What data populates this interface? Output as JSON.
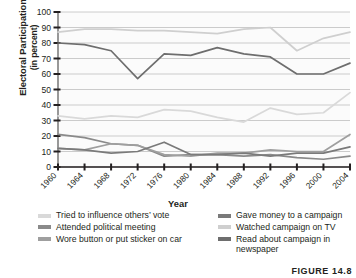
{
  "figure": {
    "caption": "FIGURE 14.8"
  },
  "axes": {
    "y_title_main": "Electoral Participation",
    "y_title_sub": "(in percent)",
    "x_title": "Year"
  },
  "legend": {
    "left_column": [
      {
        "label": "Tried to influence others’ vote",
        "color": "#d9d9d9"
      },
      {
        "label": "Attended political meeting",
        "color": "#8a8a8a"
      },
      {
        "label": "Wore button or put sticker on car",
        "color": "#9f9f9f"
      }
    ],
    "right_column": [
      {
        "label": "Gave money to a campaign",
        "color": "#7a7a7a"
      },
      {
        "label": "Watched campaign on TV",
        "color": "#cfcfcf"
      },
      {
        "label": "Read about campaign in newspaper",
        "color": "#6e6e6e"
      }
    ]
  },
  "chart_data": {
    "type": "line",
    "title": "",
    "xlabel": "Year",
    "ylabel": "Electoral Participation (in percent)",
    "ylim": [
      0,
      100
    ],
    "ytick_step": 10,
    "yticks": [
      0,
      10,
      20,
      30,
      40,
      50,
      60,
      70,
      80,
      90,
      100
    ],
    "grid": true,
    "legend_position": "bottom",
    "categories": [
      1960,
      1964,
      1968,
      1972,
      1976,
      1980,
      1984,
      1988,
      1992,
      1996,
      2000,
      2004
    ],
    "series": [
      {
        "name": "Watched campaign on TV",
        "color": "#cfcfcf",
        "values": [
          87,
          89,
          89,
          88,
          88,
          87,
          86,
          89,
          90,
          75,
          83,
          87
        ]
      },
      {
        "name": "Read about campaign in newspaper",
        "color": "#6e6e6e",
        "values": [
          80,
          79,
          75,
          57,
          73,
          72,
          77,
          73,
          71,
          60,
          60,
          67
        ]
      },
      {
        "name": "Tried to influence others’ vote",
        "color": "#d9d9d9",
        "values": [
          33,
          31,
          33,
          32,
          37,
          36,
          32,
          29,
          38,
          34,
          35,
          48
        ]
      },
      {
        "name": "Attended political meeting",
        "color": "#8a8a8a",
        "values": [
          21,
          19,
          15,
          14,
          7,
          8,
          8,
          7,
          8,
          6,
          5,
          7
        ]
      },
      {
        "name": "Wore button or put sticker on car",
        "color": "#9f9f9f",
        "values": [
          12,
          11,
          15,
          14,
          8,
          7,
          9,
          9,
          11,
          10,
          10,
          21
        ]
      },
      {
        "name": "Gave money to a campaign",
        "color": "#7a7a7a",
        "values": [
          12,
          11,
          9,
          10,
          16,
          8,
          8,
          9,
          7,
          9,
          9,
          13
        ]
      }
    ]
  }
}
